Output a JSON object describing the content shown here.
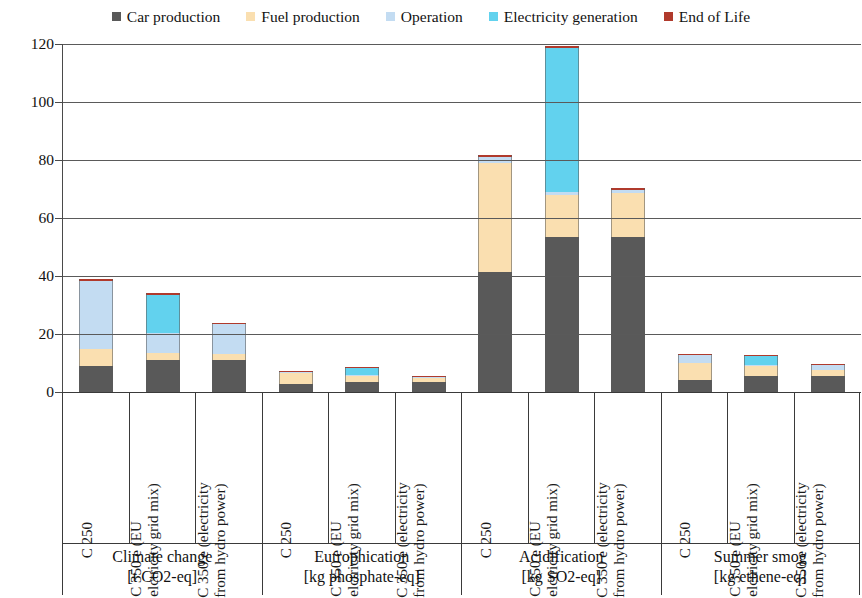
{
  "chart_data": {
    "type": "bar",
    "stacked": true,
    "title": "",
    "subtitle": "",
    "xlabel": "",
    "ylabel": "[unit/car]",
    "ylim": [
      0,
      120
    ],
    "yticks": [
      0,
      20,
      40,
      60,
      80,
      100,
      120
    ],
    "ytick_labels": [
      "0",
      "20",
      "40",
      "60",
      "80",
      "100",
      "120"
    ],
    "grid": true,
    "legend_position": "top",
    "legend": [
      {
        "label": "Car production",
        "color": "#595959"
      },
      {
        "label": "Fuel production",
        "color": "#fadfb0"
      },
      {
        "label": "Operation",
        "color": "#c3dcf2"
      },
      {
        "label": "Electricity generation",
        "color": "#62d2ee"
      },
      {
        "label": "End of Life",
        "color": "#b03a2c"
      }
    ],
    "series": [
      {
        "name": "Car production",
        "color": "#595959",
        "values": [
          9.0,
          11.2,
          11.2,
          2.8,
          3.5,
          3.5,
          41.5,
          53.5,
          53.5,
          4.0,
          5.5,
          5.5
        ]
      },
      {
        "name": "Fuel production",
        "color": "#fadfb0",
        "values": [
          6.0,
          2.3,
          1.8,
          3.7,
          2.0,
          1.5,
          37.5,
          14.5,
          15.0,
          6.0,
          3.5,
          2.0
        ]
      },
      {
        "name": "Operation",
        "color": "#c3dcf2",
        "values": [
          23.2,
          7.0,
          10.5,
          0.6,
          0.4,
          0.3,
          2.0,
          1.0,
          1.3,
          3.0,
          0.4,
          2.0
        ]
      },
      {
        "name": "Electricity generation",
        "color": "#62d2ee",
        "values": [
          0.0,
          13.0,
          0.0,
          0.0,
          2.6,
          0.0,
          0.0,
          49.5,
          0.0,
          0.0,
          3.1,
          0.0
        ]
      },
      {
        "name": "End of Life",
        "color": "#b03a2c",
        "values": [
          0.8,
          0.5,
          0.4,
          0.15,
          0.15,
          0.15,
          0.6,
          0.8,
          0.6,
          0.2,
          0.2,
          0.2
        ]
      }
    ],
    "categories": [
      "C 250",
      "C 350 e (EU elctricity grid mix)",
      "C 350 e (electricity from hydro power)",
      "C 250",
      "C 350 e (EU elctricity grid mix)",
      "C 350 e (electricity from hydro power)",
      "C 250",
      "C 350 e (EU elctricity grid mix)",
      "C 350 e (electricity from hydro power)",
      "C 250",
      "C 350 e (EU elctricity grid mix)",
      "C 350 e (electricity from hydro power)"
    ],
    "category_lines": [
      [
        "C 250",
        ""
      ],
      [
        "C 350 e (EU",
        "elctricity grid mix)"
      ],
      [
        "C 350 e (electricity",
        "from hydro power)"
      ],
      [
        "C 250",
        ""
      ],
      [
        "C 350 e (EU",
        "elctricity grid mix)"
      ],
      [
        "C 350 e (electricity",
        "from hydro power)"
      ],
      [
        "C 250",
        ""
      ],
      [
        "C 350 e (EU",
        "elctricity grid mix)"
      ],
      [
        "C 350 e (electricity",
        "from hydro power)"
      ],
      [
        "C 250",
        ""
      ],
      [
        "C 350 e (EU",
        "elctricity grid mix)"
      ],
      [
        "C 350 e (electricity",
        "from hydro power)"
      ]
    ],
    "groups": [
      {
        "name": "Climate change",
        "unit": "[t CO2-eq]"
      },
      {
        "name": "Eutrophication",
        "unit": "[kg phosphate-eq]"
      },
      {
        "name": "Acidification",
        "unit": "[kg SO2-eq]"
      },
      {
        "name": "Summer smog",
        "unit": "[kg ethene-eq]"
      }
    ],
    "group_totals": [
      39.0,
      34.0,
      23.9,
      7.25,
      8.65,
      5.45,
      81.6,
      119.3,
      70.4,
      13.2,
      12.7,
      9.7
    ]
  }
}
